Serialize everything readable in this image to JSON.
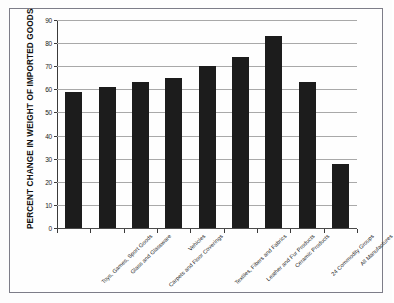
{
  "chart_data": {
    "type": "bar",
    "title": "",
    "xlabel": "",
    "ylabel": "PERCENT CHANGE IN WEIGHT OF IMPORTED GOODS",
    "ylim": [
      0,
      90
    ],
    "yticks": [
      0,
      10,
      20,
      30,
      40,
      50,
      60,
      70,
      80,
      90
    ],
    "grid": true,
    "legend": "none",
    "bar_color": "#1c1c1c",
    "categories": [
      "Toys, Games, Sport Goods",
      "Glass and Glassware",
      "Carpets and Floor Coverings",
      "Vehicles",
      "Textiles, Fibers and Fabrics",
      "Leather and Fur Products",
      "Ceramic Products",
      "24 Commodity Groups",
      "All Manufactures"
    ],
    "values": [
      58.7,
      61.0,
      63.0,
      65.0,
      70.3,
      74.0,
      83.0,
      63.3,
      27.8
    ]
  }
}
